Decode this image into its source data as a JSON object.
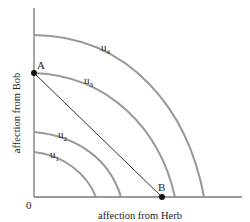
{
  "diagram": {
    "type": "utility-possibility-frontiers",
    "xlabel": "affection from Herb",
    "ylabel": "affection from Bob",
    "origin_label": "0",
    "curves": [
      {
        "id": "u1",
        "label": "u",
        "sub": "1"
      },
      {
        "id": "u2",
        "label": "u",
        "sub": "2"
      },
      {
        "id": "u3",
        "label": "u",
        "sub": "3"
      },
      {
        "id": "u4",
        "label": "u",
        "sub": "4"
      }
    ],
    "points": [
      {
        "id": "A",
        "label": "A"
      },
      {
        "id": "B",
        "label": "B"
      }
    ],
    "colors": {
      "axes": "#777777",
      "curves": "#999999",
      "line": "#333333",
      "points": "#111111"
    }
  }
}
